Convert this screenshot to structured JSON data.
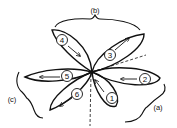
{
  "diagram": {
    "type": "rosette-of-lobes",
    "center": [
      92,
      72
    ],
    "lobes": [
      {
        "id": "1",
        "label": "1",
        "arrow_direction": "toward-center (up-left)"
      },
      {
        "id": "2",
        "label": "2",
        "arrow_direction": "toward-center (left)"
      },
      {
        "id": "3",
        "label": "3",
        "arrow_direction": "away-from-center (up-right)"
      },
      {
        "id": "4",
        "label": "4",
        "arrow_direction": "toward-center (down-right)"
      },
      {
        "id": "5",
        "label": "5",
        "arrow_direction": "away-from-center (left)"
      },
      {
        "id": "6",
        "label": "6",
        "arrow_direction": "away-from-center (down-left)"
      }
    ],
    "brackets": [
      {
        "id": "a",
        "label": "(a)",
        "groups": [
          "1",
          "2"
        ]
      },
      {
        "id": "b",
        "label": "(b)",
        "groups": [
          "3",
          "4"
        ]
      },
      {
        "id": "c",
        "label": "(c)",
        "groups": [
          "5",
          "6"
        ]
      }
    ],
    "dashed_lines": [
      "center-to-upper-right",
      "center-to-bottom"
    ],
    "colors": {
      "stroke": "#111111",
      "background": "#ffffff"
    }
  }
}
